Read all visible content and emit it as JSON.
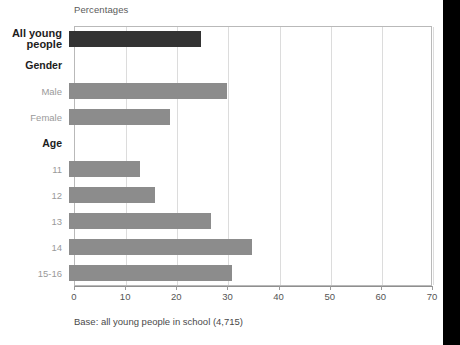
{
  "chart_data": {
    "type": "bar",
    "orientation": "horizontal",
    "title": "Percentages",
    "xlabel": "",
    "ylabel": "",
    "xlim": [
      0,
      70
    ],
    "xticks": [
      0,
      10,
      20,
      30,
      40,
      50,
      60,
      70
    ],
    "grid": true,
    "legend": "none",
    "caption": "Base: all young people in school (4,715)",
    "colors": {
      "highlight_bar": "#333333",
      "bar": "#8c8c8c",
      "gridline": "#dcdcdc",
      "frame": "#b9b9b9",
      "axis": "#8f8f8f",
      "header_text": "#1d1d1d",
      "sub_text": "#9a9a9a",
      "right_band": "#000000"
    },
    "rows": [
      {
        "label": "All young people",
        "type": "bar",
        "style": "big",
        "value": 26,
        "color": "highlight"
      },
      {
        "label": "Gender",
        "type": "header",
        "style": "header",
        "value": null,
        "color": "none"
      },
      {
        "label": "Male",
        "type": "bar",
        "style": "sub",
        "value": 31,
        "color": "normal"
      },
      {
        "label": "Female",
        "type": "bar",
        "style": "sub",
        "value": 20,
        "color": "normal"
      },
      {
        "label": "Age",
        "type": "header",
        "style": "header",
        "value": null,
        "color": "none"
      },
      {
        "label": "11",
        "type": "bar",
        "style": "sub",
        "value": 14,
        "color": "normal"
      },
      {
        "label": "12",
        "type": "bar",
        "style": "sub",
        "value": 17,
        "color": "normal"
      },
      {
        "label": "13",
        "type": "bar",
        "style": "sub",
        "value": 28,
        "color": "normal"
      },
      {
        "label": "14",
        "type": "bar",
        "style": "sub",
        "value": 36,
        "color": "normal"
      },
      {
        "label": "15-16",
        "type": "bar",
        "style": "sub",
        "value": 32,
        "color": "normal"
      }
    ],
    "categories": [
      "All young people",
      "Male",
      "Female",
      "11",
      "12",
      "13",
      "14",
      "15-16"
    ],
    "values": [
      26,
      31,
      20,
      14,
      17,
      28,
      36,
      32
    ]
  }
}
